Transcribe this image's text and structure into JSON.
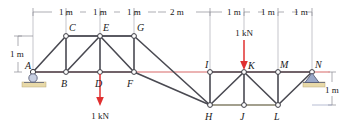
{
  "figure": {
    "units": "m",
    "colors": {
      "member": "#4a4a52",
      "chord_top": "#5a5a62",
      "reference_line": "#e08a8a",
      "dimension_line": "#8a8a92",
      "load_arrow": "#e03030",
      "ground_pad": "#e8d9a8",
      "support_fill": "#9aa8c8",
      "node_fill": "#ffffff",
      "text": "#1a1a1a"
    }
  },
  "dimensions": {
    "top": [
      {
        "label": "1 m",
        "from": "A",
        "to": "B"
      },
      {
        "label": "1 m",
        "from": "B",
        "to": "D"
      },
      {
        "label": "1 m",
        "from": "D",
        "to": "F"
      },
      {
        "label": "2 m",
        "from": "F",
        "to": "H"
      },
      {
        "label": "1 m",
        "from": "H",
        "to": "J"
      },
      {
        "label": "1 m",
        "from": "J",
        "to": "L"
      },
      {
        "label": "1 m",
        "from": "L",
        "to": "N"
      }
    ],
    "left_vertical": {
      "label": "1 m"
    },
    "right_vertical": {
      "label": "1 m"
    }
  },
  "loads": [
    {
      "id": "load-at-D",
      "label": "1 kN",
      "node": "D",
      "direction": "down"
    },
    {
      "id": "load-at-K",
      "label": "1 kN",
      "node": "K",
      "direction": "down"
    }
  ],
  "supports": [
    {
      "id": "support-A",
      "node": "A",
      "type": "roller"
    },
    {
      "id": "support-N",
      "node": "N",
      "type": "pin"
    }
  ],
  "nodes": [
    {
      "id": "A",
      "label": "A",
      "x": 33,
      "y": 72,
      "lx": 25,
      "ly": 68
    },
    {
      "id": "B",
      "label": "B",
      "x": 66,
      "y": 72,
      "lx": 61,
      "ly": 86
    },
    {
      "id": "C",
      "label": "C",
      "x": 66,
      "y": 36,
      "lx": 70,
      "ly": 31
    },
    {
      "id": "D",
      "label": "D",
      "x": 100,
      "y": 72,
      "lx": 96,
      "ly": 86
    },
    {
      "id": "E",
      "label": "E",
      "x": 100,
      "y": 36,
      "lx": 104,
      "ly": 31
    },
    {
      "id": "F",
      "label": "F",
      "x": 134,
      "y": 72,
      "lx": 128,
      "ly": 86
    },
    {
      "id": "G",
      "label": "G",
      "x": 134,
      "y": 36,
      "lx": 138,
      "ly": 31
    },
    {
      "id": "H",
      "label": "H",
      "x": 210,
      "y": 105,
      "lx": 205,
      "ly": 120
    },
    {
      "id": "I",
      "label": "I",
      "x": 210,
      "y": 72,
      "lx": 206,
      "ly": 66
    },
    {
      "id": "J",
      "label": "J",
      "x": 244,
      "y": 105,
      "lx": 240,
      "ly": 120
    },
    {
      "id": "K",
      "label": "K",
      "x": 244,
      "y": 72,
      "lx": 249,
      "ly": 66
    },
    {
      "id": "L",
      "label": "L",
      "x": 278,
      "y": 105,
      "lx": 274,
      "ly": 120
    },
    {
      "id": "M",
      "label": "M",
      "x": 278,
      "y": 72,
      "lx": 281,
      "ly": 66
    },
    {
      "id": "N",
      "label": "N",
      "x": 312,
      "y": 72,
      "lx": 315,
      "ly": 66
    }
  ],
  "members": [
    {
      "from": "A",
      "to": "B"
    },
    {
      "from": "A",
      "to": "C"
    },
    {
      "from": "B",
      "to": "C"
    },
    {
      "from": "B",
      "to": "D"
    },
    {
      "from": "B",
      "to": "E"
    },
    {
      "from": "C",
      "to": "E"
    },
    {
      "from": "D",
      "to": "E"
    },
    {
      "from": "D",
      "to": "F"
    },
    {
      "from": "E",
      "to": "F"
    },
    {
      "from": "E",
      "to": "G"
    },
    {
      "from": "F",
      "to": "G"
    },
    {
      "from": "F",
      "to": "H"
    },
    {
      "from": "G",
      "to": "H"
    },
    {
      "from": "H",
      "to": "I"
    },
    {
      "from": "H",
      "to": "J"
    },
    {
      "from": "H",
      "to": "K"
    },
    {
      "from": "I",
      "to": "K"
    },
    {
      "from": "J",
      "to": "K"
    },
    {
      "from": "J",
      "to": "L"
    },
    {
      "from": "K",
      "to": "L"
    },
    {
      "from": "K",
      "to": "M"
    },
    {
      "from": "L",
      "to": "M"
    },
    {
      "from": "L",
      "to": "N"
    },
    {
      "from": "M",
      "to": "N"
    }
  ]
}
